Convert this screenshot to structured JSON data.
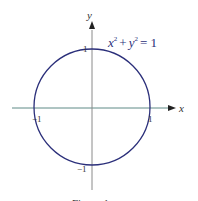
{
  "diagram": {
    "equation": {
      "x": "x",
      "plus": "+",
      "y": "y",
      "exp": "2",
      "rhs": "= 1"
    },
    "axes": {
      "x_label": "x",
      "y_label": "y"
    },
    "ticks": {
      "x_pos": "1",
      "x_neg": "−1",
      "y_pos": "1",
      "y_neg": "−1"
    },
    "caption": "Figure 1",
    "colors": {
      "circle": "#2b2f7a",
      "x_axis": "#5f8a86",
      "y_axis": "#8a8a8a",
      "text": "#333333"
    }
  }
}
